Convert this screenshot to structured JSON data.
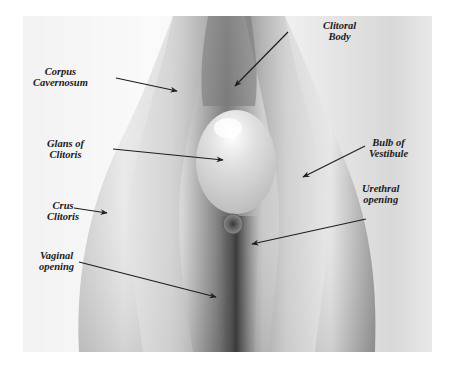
{
  "figure": {
    "type": "anatomical-illustration",
    "labels": [
      {
        "id": "corpus-cavernosum",
        "line1": "Corpus",
        "line2": "Cavernosum"
      },
      {
        "id": "clitoral-body",
        "line1": "Clitoral",
        "line2": "Body"
      },
      {
        "id": "glans-of-clitoris",
        "line1": "Glans of",
        "line2": "Clitoris"
      },
      {
        "id": "bulb-of-vestibule",
        "line1": "Bulb of",
        "line2": "Vestibule"
      },
      {
        "id": "crus-clitoris",
        "line1": "Crus",
        "line2": "Clitoris"
      },
      {
        "id": "urethral-opening",
        "line1": "Urethral",
        "line2": "opening"
      },
      {
        "id": "vaginal-opening",
        "line1": "Vaginal",
        "line2": "opening"
      }
    ]
  }
}
